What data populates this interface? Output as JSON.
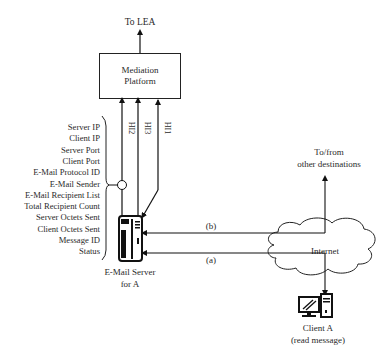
{
  "diagram": {
    "lea_label": "To LEA",
    "mediation": {
      "line1": "Mediation",
      "line2": "Platform"
    },
    "handover_interfaces": [
      "HI2",
      "HI3",
      "HI1"
    ],
    "fields": [
      "Server IP",
      "Client IP",
      "Server Port",
      "Client Port",
      "E-Mail Protocol ID",
      "E-Mail Sender",
      "E-Mail Recipient List",
      "Total Recipient Count",
      "Server Octets Sent",
      "Client Octets Sent",
      "Message ID",
      "Status"
    ],
    "server": {
      "line1": "E-Mail Server",
      "line2": "for A"
    },
    "paths": {
      "b": "(b)",
      "a": "(a)"
    },
    "internet_label": "Internet",
    "other_dest": {
      "line1": "To/from",
      "line2": "other destinations"
    },
    "client": {
      "line1": "Client A",
      "line2": "(read message)"
    }
  }
}
